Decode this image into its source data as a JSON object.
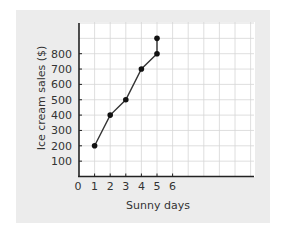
{
  "chart_data": {
    "type": "line",
    "title": "",
    "xlabel": "Sunny days",
    "ylabel": "Ice cream sales ($)",
    "x": [
      1,
      2,
      3,
      4,
      5,
      5
    ],
    "y": [
      200,
      400,
      500,
      700,
      800,
      900
    ],
    "points": [
      {
        "x": 1,
        "y": 200
      },
      {
        "x": 2,
        "y": 400
      },
      {
        "x": 3,
        "y": 500
      },
      {
        "x": 4,
        "y": 700
      },
      {
        "x": 5,
        "y": 800
      },
      {
        "x": 5,
        "y": 900
      }
    ],
    "x_ticks": [
      "0",
      "1",
      "2",
      "3",
      "4",
      "5",
      "6"
    ],
    "y_ticks": [
      "100",
      "200",
      "300",
      "400",
      "500",
      "600",
      "700",
      "800"
    ],
    "xlim": [
      0,
      11
    ],
    "ylim": [
      0,
      1000
    ],
    "grid": true,
    "legend": null
  },
  "style": {
    "panel_color": "#ececec",
    "plot_bg": "#ffffff",
    "grid_color": "#d6d6d6",
    "axis_color": "#222222",
    "line_color": "#333333",
    "marker_color": "#111111",
    "text_color": "#333333"
  }
}
